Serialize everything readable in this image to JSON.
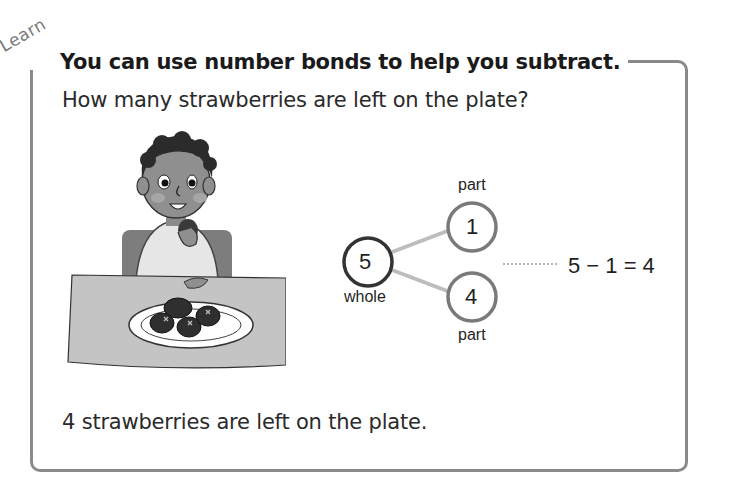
{
  "section_label": "Learn",
  "title": "You can use number bonds to help you subtract.",
  "question": "How many strawberries are left on the plate?",
  "illustration": {
    "description": "child at table eating strawberries from a plate",
    "strawberries_on_plate": 4,
    "strawberries_eaten": 1
  },
  "number_bond": {
    "whole": {
      "value": "5",
      "label": "whole"
    },
    "part_top": {
      "value": "1",
      "label": "part"
    },
    "part_bottom": {
      "value": "4",
      "label": "part"
    }
  },
  "equation": "5 − 1 = 4",
  "answer": "4 strawberries are left on the plate.",
  "colors": {
    "frame": "#8a8a8a",
    "whole_circle": "#333333",
    "part_circle": "#7a7a7a",
    "connector": "#bdbdbd",
    "text": "#2a2a2a"
  }
}
